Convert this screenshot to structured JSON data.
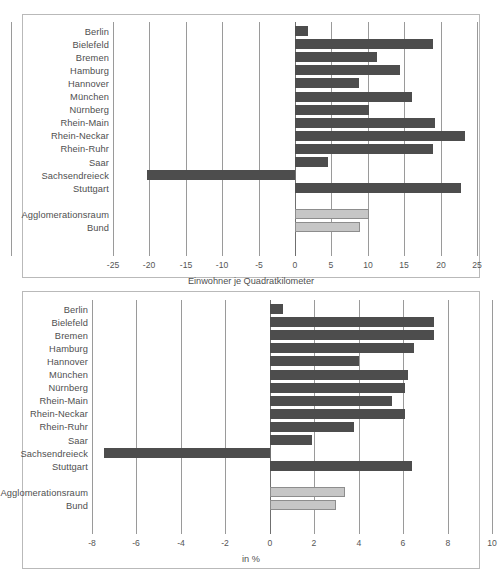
{
  "figure": {
    "background": "#ffffff",
    "bar_color_dark": "#4d4d4d",
    "bar_color_light": "#c6c6c6"
  },
  "chart_data": [
    {
      "id": "top",
      "type": "bar",
      "orientation": "horizontal",
      "title": "",
      "xlabel": "Einwohner je Quadratkilometer",
      "ylabel": "",
      "xlim": [
        -25,
        25
      ],
      "xticks": [
        -25,
        -20,
        -15,
        -10,
        -5,
        0,
        5,
        10,
        15,
        20,
        25
      ],
      "xtick_labels": [
        "-25",
        "-20",
        "-15",
        "-10",
        "-5",
        "0",
        "5",
        "10",
        "15",
        "20",
        "25"
      ],
      "grid": true,
      "legend": "none",
      "categories": [
        "Berlin",
        "Bielefeld",
        "Bremen",
        "Hamburg",
        "Hannover",
        "München",
        "Nürnberg",
        "Rhein-Main",
        "Rhein-Neckar",
        "Rhein-Ruhr",
        "Saar",
        "Sachsendreieck",
        "Stuttgart"
      ],
      "values": [
        1.8,
        18.9,
        11.3,
        14.4,
        8.8,
        16.1,
        10.1,
        19.2,
        23.4,
        18.9,
        4.6,
        -20.3,
        22.8
      ],
      "reference_categories": [
        "Agglomerationsraum",
        "Bund"
      ],
      "reference_values": [
        10.2,
        8.9
      ]
    },
    {
      "id": "bottom",
      "type": "bar",
      "orientation": "horizontal",
      "title": "",
      "xlabel": "in %",
      "ylabel": "",
      "xlim": [
        -8,
        10
      ],
      "xticks": [
        -8,
        -6,
        -4,
        -2,
        0,
        2,
        4,
        6,
        8,
        10
      ],
      "xtick_labels": [
        "-8",
        "-6",
        "-4",
        "-2",
        "0",
        "2",
        "4",
        "6",
        "8",
        "10"
      ],
      "grid": true,
      "legend": "none",
      "categories": [
        "Berlin",
        "Bielefeld",
        "Bremen",
        "Hamburg",
        "Hannover",
        "München",
        "Nürnberg",
        "Rhein-Main",
        "Rhein-Neckar",
        "Rhein-Ruhr",
        "Saar",
        "Sachsendreieck",
        "Stuttgart"
      ],
      "values": [
        0.6,
        7.4,
        7.4,
        6.5,
        4.0,
        6.2,
        6.1,
        5.5,
        6.1,
        3.8,
        1.9,
        -7.45,
        6.4
      ],
      "reference_categories": [
        "Agglomerationsraum",
        "Bund"
      ],
      "reference_values": [
        3.4,
        3.0
      ]
    }
  ]
}
